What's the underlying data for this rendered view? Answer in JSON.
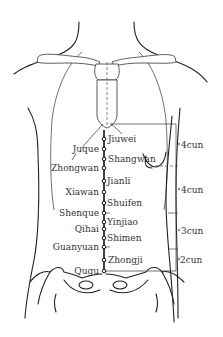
{
  "diagram": {
    "colors": {
      "line": "#222222",
      "text": "#333333",
      "background": "#ffffff"
    },
    "points_right": [
      {
        "name": "Jiuwei",
        "y": 139
      },
      {
        "name": "Shangwan",
        "y": 159
      },
      {
        "name": "Jianli",
        "y": 181
      },
      {
        "name": "Shuifen",
        "y": 203
      },
      {
        "name": "Yinjiao",
        "y": 222
      },
      {
        "name": "Shimen",
        "y": 238
      },
      {
        "name": "Zhongji",
        "y": 260
      }
    ],
    "points_left": [
      {
        "name": "Juque",
        "y": 149
      },
      {
        "name": "Zhongwan",
        "y": 168
      },
      {
        "name": "Xiawan",
        "y": 192
      },
      {
        "name": "Shenque",
        "y": 213
      },
      {
        "name": "Qihai",
        "y": 229
      },
      {
        "name": "Guanyuan",
        "y": 247
      },
      {
        "name": "Qugu",
        "y": 271
      }
    ],
    "measurements": [
      {
        "label": "4cun",
        "from_y": 124,
        "to_y": 166
      },
      {
        "label": "4cun",
        "from_y": 166,
        "to_y": 213
      },
      {
        "label": "3cun",
        "from_y": 213,
        "to_y": 249
      },
      {
        "label": "2cun",
        "from_y": 249,
        "to_y": 271
      }
    ]
  }
}
